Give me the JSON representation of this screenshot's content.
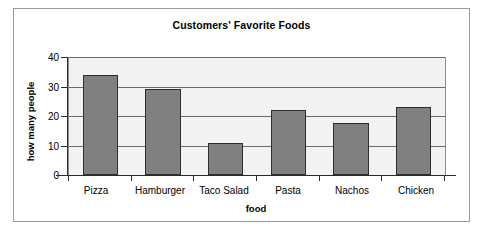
{
  "chart_data": {
    "type": "bar",
    "title": "Customers' Favorite Foods",
    "xlabel": "food",
    "ylabel": "how many people",
    "categories": [
      "Pizza",
      "Hamburger",
      "Taco Salad",
      "Pasta",
      "Nachos",
      "Chicken"
    ],
    "values": [
      34,
      29,
      11,
      22,
      17.5,
      23
    ],
    "ylim": [
      0,
      40
    ],
    "ytick_labels": [
      "40",
      "30",
      "20",
      "10",
      "0"
    ],
    "ytick_values": [
      40,
      30,
      20,
      10,
      0
    ],
    "grid": true,
    "grid_axis": "y",
    "legend": false,
    "legend_position": "none",
    "series": [
      {
        "name": "how many people",
        "values": [
          34,
          29,
          11,
          22,
          17.5,
          23
        ]
      }
    ],
    "colors": {
      "bar_fill": "#808080",
      "bar_border": "#2e2e2e",
      "plot_background": "#f2f2f2",
      "gridline": "#6b6b6b",
      "axis": "#2b2b2b",
      "figure_border": "#9a9a9a",
      "text": "#000000"
    }
  }
}
